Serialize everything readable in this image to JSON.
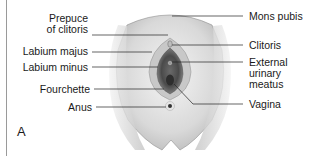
{
  "figure": {
    "panel_letter": "A",
    "labels_left": [
      {
        "id": "prepuce",
        "line1": "Prepuce",
        "line2": "of clitoris"
      },
      {
        "id": "labium-majus",
        "line1": "Labium majus"
      },
      {
        "id": "labium-minus",
        "line1": "Labium minus"
      },
      {
        "id": "fourchette",
        "line1": "Fourchette"
      },
      {
        "id": "anus",
        "line1": "Anus"
      }
    ],
    "labels_right": [
      {
        "id": "mons-pubis",
        "line1": "Mons pubis"
      },
      {
        "id": "clitoris",
        "line1": "Clitoris"
      },
      {
        "id": "external-urinary-meatus",
        "line1": "External",
        "line2": "urinary",
        "line3": "meatus"
      },
      {
        "id": "vagina",
        "line1": "Vagina"
      }
    ]
  }
}
